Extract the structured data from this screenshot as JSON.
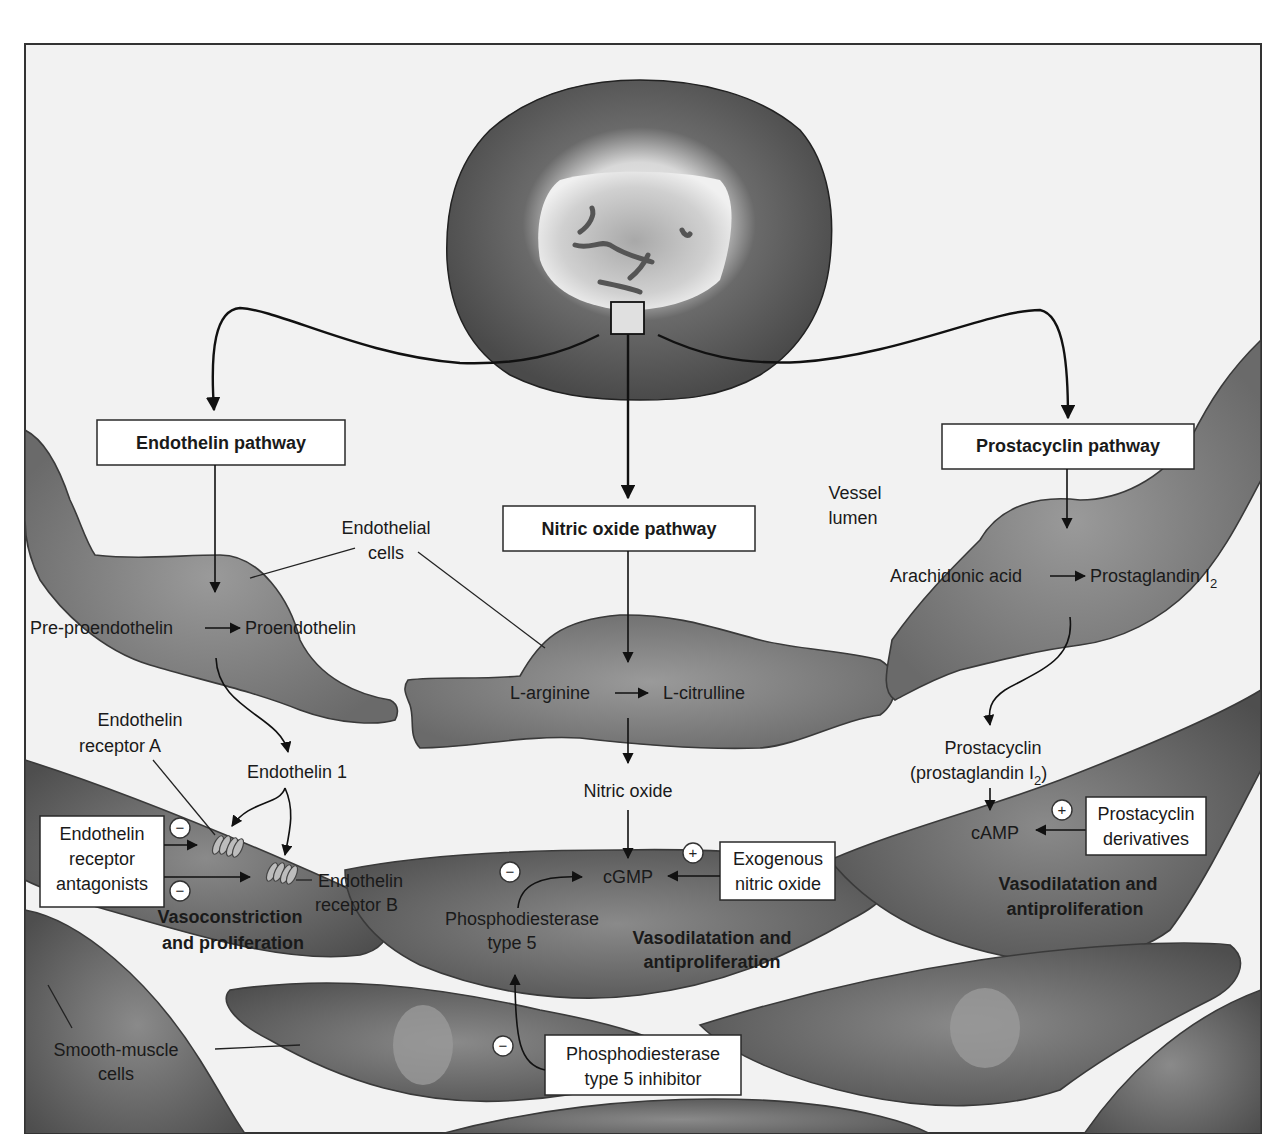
{
  "figure": {
    "frame": {
      "x": 25,
      "y": 44,
      "width": 1236,
      "height": 1089
    },
    "colors": {
      "background": "#f2f2f2",
      "frame_border": "#333333",
      "endothelial_cell": "#8a8a8a",
      "smooth_muscle_cell": "#6e6e6e",
      "smooth_muscle_nucleus": "#9a9a9a",
      "cell_body_dark": "#555555",
      "nucleus_light": "#e6e6e6",
      "chromatin": "#5a5a5a",
      "box_fill": "#ffffff",
      "text": "#1a1a1a"
    }
  },
  "pathways": {
    "endothelin": {
      "label": "Endothelin pathway"
    },
    "nitric_oxide": {
      "label": "Nitric oxide pathway"
    },
    "prostacyclin": {
      "label": "Prostacyclin pathway"
    }
  },
  "labels": {
    "endothelial_cells": [
      "Endothelial",
      "cells"
    ],
    "vessel_lumen": [
      "Vessel",
      "lumen"
    ],
    "pre_proendothelin": "Pre-proendothelin",
    "proendothelin": "Proendothelin",
    "l_arginine": "L-arginine",
    "l_citrulline": "L-citrulline",
    "arachidonic_acid": "Arachidonic acid",
    "prostaglandin_i2": {
      "text": "Prostaglandin I",
      "sub": "2"
    },
    "endothelin_receptor_a": [
      "Endothelin",
      "receptor A"
    ],
    "endothelin_1": "Endothelin 1",
    "endothelin_receptor_b": [
      "Endothelin",
      "receptor B"
    ],
    "nitric_oxide": "Nitric oxide",
    "prostacyclin": [
      "Prostacyclin",
      "(prostaglandin I",
      "2",
      ")"
    ],
    "camp": "cAMP",
    "cgmp": "cGMP",
    "phosphodiesterase_type5": [
      "Phosphodiesterase",
      "type 5"
    ],
    "vasoconstriction": [
      "Vasoconstriction",
      "and proliferation"
    ],
    "vasodilatation_center": [
      "Vasodilatation and",
      "antiproliferation"
    ],
    "vasodilatation_right": [
      "Vasodilatation and",
      "antiproliferation"
    ],
    "smooth_muscle_cells": [
      "Smooth-muscle",
      "cells"
    ]
  },
  "drug_boxes": {
    "endothelin_receptor_antagonists": {
      "lines": [
        "Endothelin",
        "receptor",
        "antagonists"
      ],
      "effect": "−"
    },
    "exogenous_nitric_oxide": {
      "lines": [
        "Exogenous",
        "nitric oxide"
      ],
      "effect": "+"
    },
    "prostacyclin_derivatives": {
      "lines": [
        "Prostacyclin",
        "derivatives"
      ],
      "effect": "+"
    },
    "pde5_inhibitor": {
      "lines": [
        "Phosphodiesterase",
        "type 5 inhibitor"
      ],
      "effect": "−"
    }
  },
  "signs": {
    "minus": "−",
    "plus": "+"
  }
}
